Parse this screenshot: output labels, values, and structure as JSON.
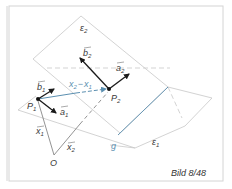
{
  "figure": {
    "caption": "Bild 8/48",
    "colors": {
      "plane_edge": "#c8c8c8",
      "vector": "#1a1a1a",
      "thin_line": "#777777",
      "blue": "#5b8fb0",
      "frame": "#d4d4d4"
    },
    "planes": [
      {
        "name": "ε",
        "subscript": "2"
      },
      {
        "name": "ε",
        "subscript": "1"
      }
    ],
    "points": [
      {
        "name": "P",
        "subscript": "1"
      },
      {
        "name": "P",
        "subscript": "2"
      },
      {
        "name": "O",
        "subscript": ""
      }
    ],
    "line": {
      "name": "g"
    },
    "vectors": [
      {
        "name": "a",
        "subscript": "1"
      },
      {
        "name": "b",
        "subscript": "1"
      },
      {
        "name": "a",
        "subscript": "2"
      },
      {
        "name": "b",
        "subscript": "2"
      },
      {
        "name": "x",
        "subscript": "1"
      },
      {
        "name": "x",
        "subscript": "2"
      }
    ],
    "difference_label": {
      "left": "x",
      "left_sub": "2",
      "minus": "−",
      "right": "x",
      "right_sub": "1"
    }
  }
}
